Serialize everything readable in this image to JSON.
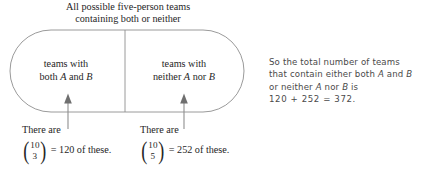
{
  "diagram": {
    "title": {
      "line1": "All possible five-person teams",
      "line2": "containing both or neither"
    },
    "shape": {
      "name": "stadium",
      "stroke_color": "#8a8a8a",
      "fill_color": "#ffffff",
      "divider": true
    },
    "compartments": [
      {
        "id": "both",
        "line1": "teams with",
        "line2_prefix": "both ",
        "line2_var1": "A",
        "line2_mid": " and ",
        "line2_var2": "B"
      },
      {
        "id": "neither",
        "line1": "teams with",
        "line2_prefix": "neither ",
        "line2_var1": "A",
        "line2_mid": " nor ",
        "line2_var2": "B"
      }
    ],
    "arrows": [
      {
        "id": "arrow-to-both",
        "direction": "up"
      },
      {
        "id": "arrow-to-neither",
        "direction": "up"
      }
    ],
    "captions": [
      {
        "id": "caption-both",
        "lead": "There are",
        "binom_top": "10",
        "binom_bottom": "3",
        "equals": "= 120 of these."
      },
      {
        "id": "caption-neither",
        "lead": "There are",
        "binom_top": "10",
        "binom_bottom": "5",
        "equals": "= 252 of these."
      }
    ]
  },
  "explanation": {
    "line1": "So the total number of teams",
    "line2_a": "that contain either both ",
    "line2_var1": "A",
    "line2_b": " and ",
    "line2_var2": "B",
    "line3_a": "or neither ",
    "line3_var1": "A",
    "line3_b": " nor ",
    "line3_var2": "B",
    "line3_c": " is",
    "line4": "120 + 252 = 372."
  }
}
